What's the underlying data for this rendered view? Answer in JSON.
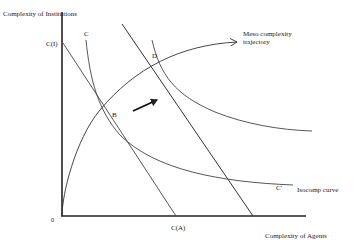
{
  "diagram": {
    "y_axis_label": "Complexity of Institutions",
    "x_axis_label": "Complexity of Agents",
    "origin_label": "0",
    "points": {
      "B": "B",
      "D": "D"
    },
    "curve_labels": {
      "C_top": "C",
      "C_prime": "C'",
      "C_I": "C(I)",
      "C_A": "C(A)"
    },
    "annotations": {
      "meso_trajectory": "Meso complexity trajectory",
      "isocomp_curve": "Isocomp curve"
    },
    "colors": {
      "line": "#333333",
      "background": "#ffffff"
    }
  }
}
